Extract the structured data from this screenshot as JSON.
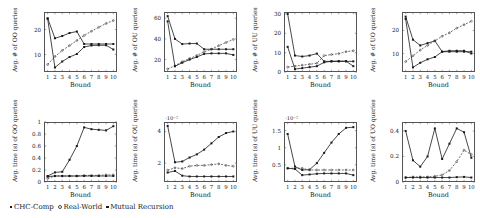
{
  "figure": {
    "xlabel": "Bound",
    "x_ticks": [
      "1",
      "2",
      "3",
      "4",
      "5",
      "6",
      "7",
      "8",
      "9",
      "10"
    ]
  },
  "legend": {
    "entries": [
      {
        "label": "CHC-Comp",
        "marker": "square"
      },
      {
        "label": "Real-World",
        "marker": "dot"
      },
      {
        "label": "Mutual Recursion",
        "marker": "square"
      }
    ]
  },
  "chart_data": [
    {
      "id": "oo-count",
      "type": "line",
      "title": "",
      "ylabel": "Avg. # of OO queries",
      "xlabel": "Bound",
      "x": [
        1,
        2,
        3,
        4,
        5,
        6,
        7,
        8,
        9,
        10
      ],
      "xlim": [
        0.5,
        10.5
      ],
      "ylim": [
        3,
        27
      ],
      "y_ticks": [
        10,
        20
      ],
      "exponent": "",
      "grid": false,
      "series": [
        {
          "name": "CHC-Comp",
          "values": [
            24.5,
            16.5,
            17.4,
            18.6,
            19.2,
            14.2,
            14.2,
            14.2,
            14.2,
            14.2
          ]
        },
        {
          "name": "Real-World",
          "values": [
            6.0,
            9.2,
            11.6,
            13.6,
            15.6,
            17.6,
            19.3,
            20.9,
            22.4,
            23.6
          ]
        },
        {
          "name": "Mutual Recursion",
          "values": [
            24.3,
            4.8,
            7.2,
            9.0,
            10.2,
            13.0,
            13.6,
            13.7,
            13.7,
            12.0
          ]
        }
      ]
    },
    {
      "id": "ou-count",
      "type": "line",
      "title": "",
      "ylabel": "Avg. # of OU queries",
      "xlabel": "Bound",
      "x": [
        1,
        2,
        3,
        4,
        5,
        6,
        7,
        8,
        9,
        10
      ],
      "xlim": [
        0.5,
        10.5
      ],
      "ylim": [
        8,
        66
      ],
      "y_ticks": [
        20,
        40,
        60
      ],
      "exponent": "",
      "grid": false,
      "series": [
        {
          "name": "CHC-Comp",
          "values": [
            62.0,
            40.0,
            35.0,
            35.5,
            35.5,
            30.0,
            30.0,
            30.0,
            30.0,
            30.0
          ]
        },
        {
          "name": "Real-World",
          "values": [
            11.0,
            14.0,
            18.0,
            21.0,
            24.0,
            27.5,
            30.0,
            33.5,
            36.5,
            39.5
          ]
        },
        {
          "name": "Mutual Recursion",
          "values": [
            57.0,
            13.5,
            17.0,
            20.0,
            22.5,
            25.5,
            26.0,
            26.0,
            26.0,
            24.5
          ]
        }
      ]
    },
    {
      "id": "uu-count",
      "type": "line",
      "title": "",
      "ylabel": "Avg. # of UU queries",
      "xlabel": "Bound",
      "x": [
        1,
        2,
        3,
        4,
        5,
        6,
        7,
        8,
        9,
        10
      ],
      "xlim": [
        0.5,
        10.5
      ],
      "ylim": [
        0,
        31
      ],
      "y_ticks": [
        0,
        10,
        20,
        30
      ],
      "exponent": "",
      "grid": false,
      "series": [
        {
          "name": "CHC-Comp",
          "values": [
            30.0,
            8.5,
            8.0,
            8.5,
            9.5,
            5.5,
            5.5,
            5.5,
            5.5,
            5.5
          ]
        },
        {
          "name": "Real-World",
          "values": [
            2.5,
            3.0,
            3.5,
            4.0,
            4.5,
            8.5,
            9.0,
            9.5,
            10.5,
            11.0
          ]
        },
        {
          "name": "Mutual Recursion",
          "values": [
            13.0,
            1.5,
            2.0,
            2.5,
            3.0,
            5.0,
            5.5,
            5.6,
            5.6,
            3.0
          ]
        }
      ]
    },
    {
      "id": "uo-count",
      "type": "line",
      "title": "",
      "ylabel": "Avg. # of UO queries",
      "xlabel": "Bound",
      "x": [
        1,
        2,
        3,
        4,
        5,
        6,
        7,
        8,
        9,
        10
      ],
      "xlim": [
        0.5,
        10.5
      ],
      "ylim": [
        2,
        28
      ],
      "y_ticks": [
        10,
        20
      ],
      "exponent": "",
      "grid": false,
      "series": [
        {
          "name": "CHC-Comp",
          "values": [
            26.0,
            16.0,
            13.5,
            14.5,
            15.5,
            10.8,
            10.8,
            10.8,
            10.8,
            10.8
          ]
        },
        {
          "name": "Real-World",
          "values": [
            6.5,
            9.0,
            11.5,
            13.5,
            15.5,
            17.5,
            19.0,
            21.0,
            22.5,
            24.0
          ]
        },
        {
          "name": "Mutual Recursion",
          "values": [
            25.0,
            4.0,
            6.0,
            7.5,
            8.5,
            10.8,
            11.2,
            11.2,
            11.2,
            10.0
          ]
        }
      ]
    },
    {
      "id": "oo-time",
      "type": "line",
      "title": "",
      "ylabel": "Avg. time (s) of OO queries",
      "xlabel": "Bound",
      "x": [
        1,
        2,
        3,
        4,
        5,
        6,
        7,
        8,
        9,
        10
      ],
      "xlim": [
        0.5,
        10.5
      ],
      "ylim": [
        0,
        1.0
      ],
      "y_ticks": [
        0,
        0.2,
        0.4,
        0.6,
        0.8,
        1
      ],
      "exponent": "",
      "grid": false,
      "series": [
        {
          "name": "CHC-Comp",
          "values": [
            0.1,
            0.16,
            0.17,
            0.37,
            0.6,
            0.91,
            0.88,
            0.87,
            0.86,
            0.93
          ]
        },
        {
          "name": "Real-World",
          "values": [
            0.06,
            0.1,
            0.1,
            0.1,
            0.1,
            0.11,
            0.11,
            0.11,
            0.12,
            0.12
          ]
        },
        {
          "name": "Mutual Recursion",
          "values": [
            0.09,
            0.1,
            0.1,
            0.1,
            0.1,
            0.1,
            0.1,
            0.1,
            0.1,
            0.1
          ]
        }
      ]
    },
    {
      "id": "ou-time",
      "type": "line",
      "title": "",
      "ylabel": "Avg. time (s) of OU queries",
      "xlabel": "Bound",
      "x": [
        1,
        2,
        3,
        4,
        5,
        6,
        7,
        8,
        9,
        10
      ],
      "xlim": [
        0.5,
        10.5
      ],
      "ylim": [
        0.8,
        4.6
      ],
      "y_ticks": [
        2,
        4
      ],
      "exponent": "·10⁻²",
      "grid": false,
      "series": [
        {
          "name": "CHC-Comp",
          "values": [
            4.35,
            2.05,
            2.1,
            2.35,
            2.55,
            2.85,
            3.25,
            3.65,
            3.9,
            4.0
          ]
        },
        {
          "name": "Real-World",
          "values": [
            1.55,
            1.7,
            1.65,
            1.8,
            1.85,
            1.85,
            1.9,
            1.95,
            1.85,
            1.8
          ]
        },
        {
          "name": "Mutual Recursion",
          "values": [
            1.4,
            1.5,
            1.2,
            1.15,
            1.15,
            1.15,
            1.15,
            1.15,
            1.15,
            1.15
          ]
        }
      ]
    },
    {
      "id": "uu-time",
      "type": "line",
      "title": "",
      "ylabel": "Avg. time (s) of UU queries",
      "xlabel": "Bound",
      "x": [
        1,
        2,
        3,
        4,
        5,
        6,
        7,
        8,
        9,
        10
      ],
      "xlim": [
        0.5,
        10.5
      ],
      "ylim": [
        0,
        1.75
      ],
      "y_ticks": [
        0.5,
        1,
        1.5
      ],
      "exponent": "·10⁻²",
      "grid": false,
      "series": [
        {
          "name": "CHC-Comp",
          "values": [
            1.4,
            0.45,
            0.35,
            0.36,
            0.55,
            0.85,
            1.15,
            1.4,
            1.58,
            1.6
          ]
        },
        {
          "name": "Real-World",
          "values": [
            0.4,
            0.4,
            0.4,
            0.35,
            0.35,
            0.35,
            0.35,
            0.35,
            0.35,
            0.35
          ]
        },
        {
          "name": "Mutual Recursion",
          "values": [
            0.4,
            0.38,
            0.2,
            0.22,
            0.24,
            0.25,
            0.25,
            0.25,
            0.25,
            0.2
          ]
        }
      ]
    },
    {
      "id": "uo-time",
      "type": "line",
      "title": "",
      "ylabel": "Avg. time (s) of UO queries",
      "xlabel": "Bound",
      "x": [
        1,
        2,
        3,
        4,
        5,
        6,
        7,
        8,
        9,
        10
      ],
      "xlim": [
        0.5,
        10.5
      ],
      "ylim": [
        0,
        0.47
      ],
      "y_ticks": [
        0,
        0.2,
        0.4
      ],
      "exponent": "",
      "grid": false,
      "series": [
        {
          "name": "CHC-Comp",
          "values": [
            0.4,
            0.17,
            0.12,
            0.2,
            0.42,
            0.18,
            0.3,
            0.42,
            0.39,
            0.19
          ]
        },
        {
          "name": "Real-World",
          "values": [
            0.035,
            0.04,
            0.04,
            0.04,
            0.045,
            0.055,
            0.09,
            0.16,
            0.25,
            0.215
          ]
        },
        {
          "name": "Mutual Recursion",
          "values": [
            0.035,
            0.035,
            0.035,
            0.035,
            0.035,
            0.035,
            0.035,
            0.038,
            0.04,
            0.035
          ]
        }
      ]
    }
  ]
}
